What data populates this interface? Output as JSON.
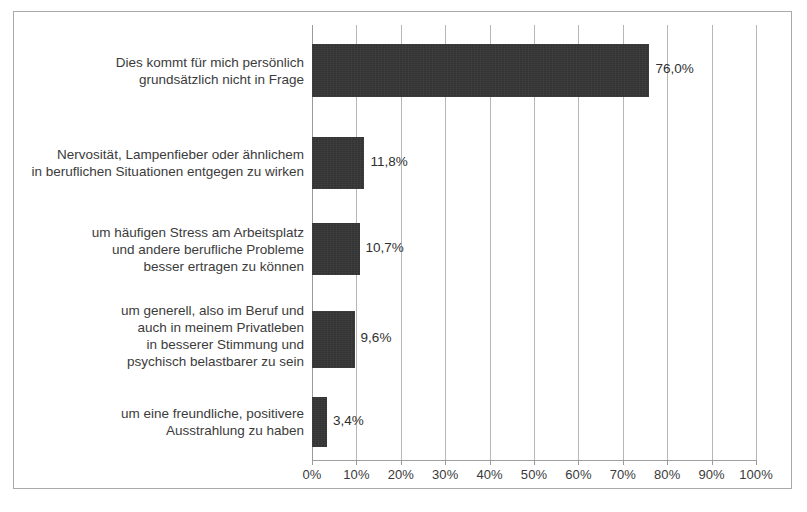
{
  "chart_data": {
    "type": "bar",
    "orientation": "horizontal",
    "title": "",
    "subtitle": "",
    "xlabel": "",
    "ylabel": "",
    "xlim": [
      0,
      100
    ],
    "grid": true,
    "legend": null,
    "value_suffix": "%",
    "decimal_separator": ",",
    "categories": [
      "Dies kommt für mich persönlich\ngrundsätzlich nicht in Frage",
      "Nervosität, Lampenfieber oder ähnlichem\nin beruflichen Situationen entgegen zu wirken",
      "um häufigen Stress am Arbeitsplatz\nund andere berufliche Probleme\nbesser ertragen zu können",
      "um generell, also im Beruf und\nauch in meinem Privatleben\nin besserer Stimmung und\npsychisch belastbarer zu sein",
      "um eine freundliche, positivere\nAusstrahlung zu haben"
    ],
    "values": [
      76.0,
      11.8,
      10.7,
      9.6,
      3.4
    ],
    "value_labels": [
      "76,0%",
      "11,8%",
      "10,7%",
      "9,6%",
      "3,4%"
    ],
    "xticks": [
      0,
      10,
      20,
      30,
      40,
      50,
      60,
      70,
      80,
      90,
      100
    ],
    "xtick_labels": [
      "0%",
      "10%",
      "20%",
      "30%",
      "40%",
      "50%",
      "60%",
      "70%",
      "80%",
      "90%",
      "100%"
    ],
    "colors": {
      "bar": "#333333",
      "gridline": "#b6b6b6",
      "axis": "#9a9a9a",
      "text": "#3b3b3b",
      "border": "#a9a9a9",
      "background": "#ffffff"
    }
  }
}
